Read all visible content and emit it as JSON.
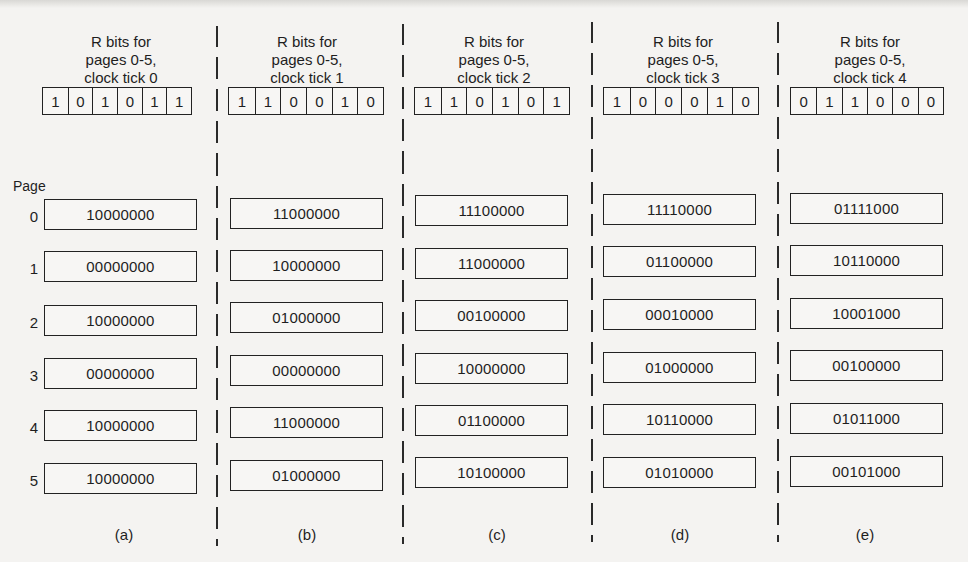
{
  "figure": {
    "page_axis_label": "Page",
    "page_numbers": [
      "0",
      "1",
      "2",
      "3",
      "4",
      "5"
    ],
    "panels": [
      {
        "title": [
          "R bits for",
          "pages 0-5,",
          "clock tick 0"
        ],
        "r_bits": [
          "1",
          "0",
          "1",
          "0",
          "1",
          "1"
        ],
        "counters": [
          "10000000",
          "00000000",
          "10000000",
          "00000000",
          "10000000",
          "10000000"
        ],
        "label": "(a)"
      },
      {
        "title": [
          "R bits for",
          "pages 0-5,",
          "clock tick 1"
        ],
        "r_bits": [
          "1",
          "1",
          "0",
          "0",
          "1",
          "0"
        ],
        "counters": [
          "11000000",
          "10000000",
          "01000000",
          "00000000",
          "11000000",
          "01000000"
        ],
        "label": "(b)"
      },
      {
        "title": [
          "R bits for",
          "pages 0-5,",
          "clock tick 2"
        ],
        "r_bits": [
          "1",
          "1",
          "0",
          "1",
          "0",
          "1"
        ],
        "counters": [
          "11100000",
          "11000000",
          "00100000",
          "10000000",
          "01100000",
          "10100000"
        ],
        "label": "(c)"
      },
      {
        "title": [
          "R bits for",
          "pages 0-5,",
          "clock tick 3"
        ],
        "r_bits": [
          "1",
          "0",
          "0",
          "0",
          "1",
          "0"
        ],
        "counters": [
          "11110000",
          "01100000",
          "00010000",
          "01000000",
          "10110000",
          "01010000"
        ],
        "label": "(d)"
      },
      {
        "title": [
          "R bits for",
          "pages 0-5,",
          "clock tick 4"
        ],
        "r_bits": [
          "0",
          "1",
          "1",
          "0",
          "0",
          "0"
        ],
        "counters": [
          "01111000",
          "10110000",
          "10001000",
          "00100000",
          "01011000",
          "00101000"
        ],
        "label": "(e)"
      }
    ]
  }
}
